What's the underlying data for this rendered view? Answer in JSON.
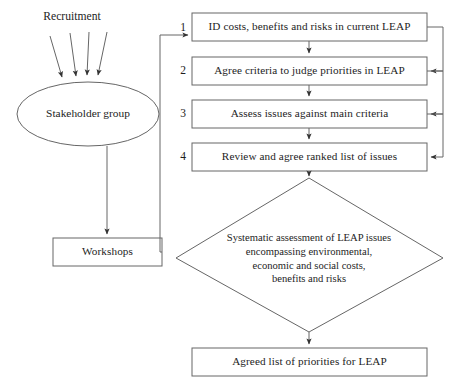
{
  "diagram": {
    "stroke_color": "#555555",
    "text_color": "#1d1d1d",
    "background": "#ffffff"
  },
  "recruitment": {
    "label": "Recruitment",
    "arrow_count": 4
  },
  "stakeholder": {
    "label": "Stakeholder group"
  },
  "workshops": {
    "label": "Workshops"
  },
  "steps": [
    {
      "number": "1",
      "label": "ID costs, benefits and risks in current LEAP"
    },
    {
      "number": "2",
      "label": "Agree criteria to judge priorities in LEAP"
    },
    {
      "number": "3",
      "label": "Assess issues against main criteria"
    },
    {
      "number": "4",
      "label": "Review and agree ranked list of issues"
    }
  ],
  "decision": {
    "line1": "Systematic assessment of LEAP issues",
    "line2": "encompassing environmental,",
    "line3": "economic and social costs,",
    "line4": "benefits and risks",
    "text": "Systematic assessment of LEAP issues\nencompassing environmental,\neconomic and social costs,\nbenefits and risks"
  },
  "outcome": {
    "label": "Agreed list of priorities for LEAP"
  }
}
